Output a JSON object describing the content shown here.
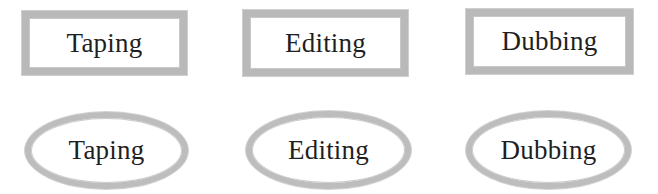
{
  "diagram": {
    "rectangles": [
      {
        "label": "Taping"
      },
      {
        "label": "Editing"
      },
      {
        "label": "Dubbing"
      }
    ],
    "ellipses": [
      {
        "label": "Taping"
      },
      {
        "label": "Editing"
      },
      {
        "label": "Dubbing"
      }
    ],
    "colors": {
      "border": "#b9b9b9",
      "text": "#1f1f1f",
      "background": "#ffffff"
    }
  }
}
